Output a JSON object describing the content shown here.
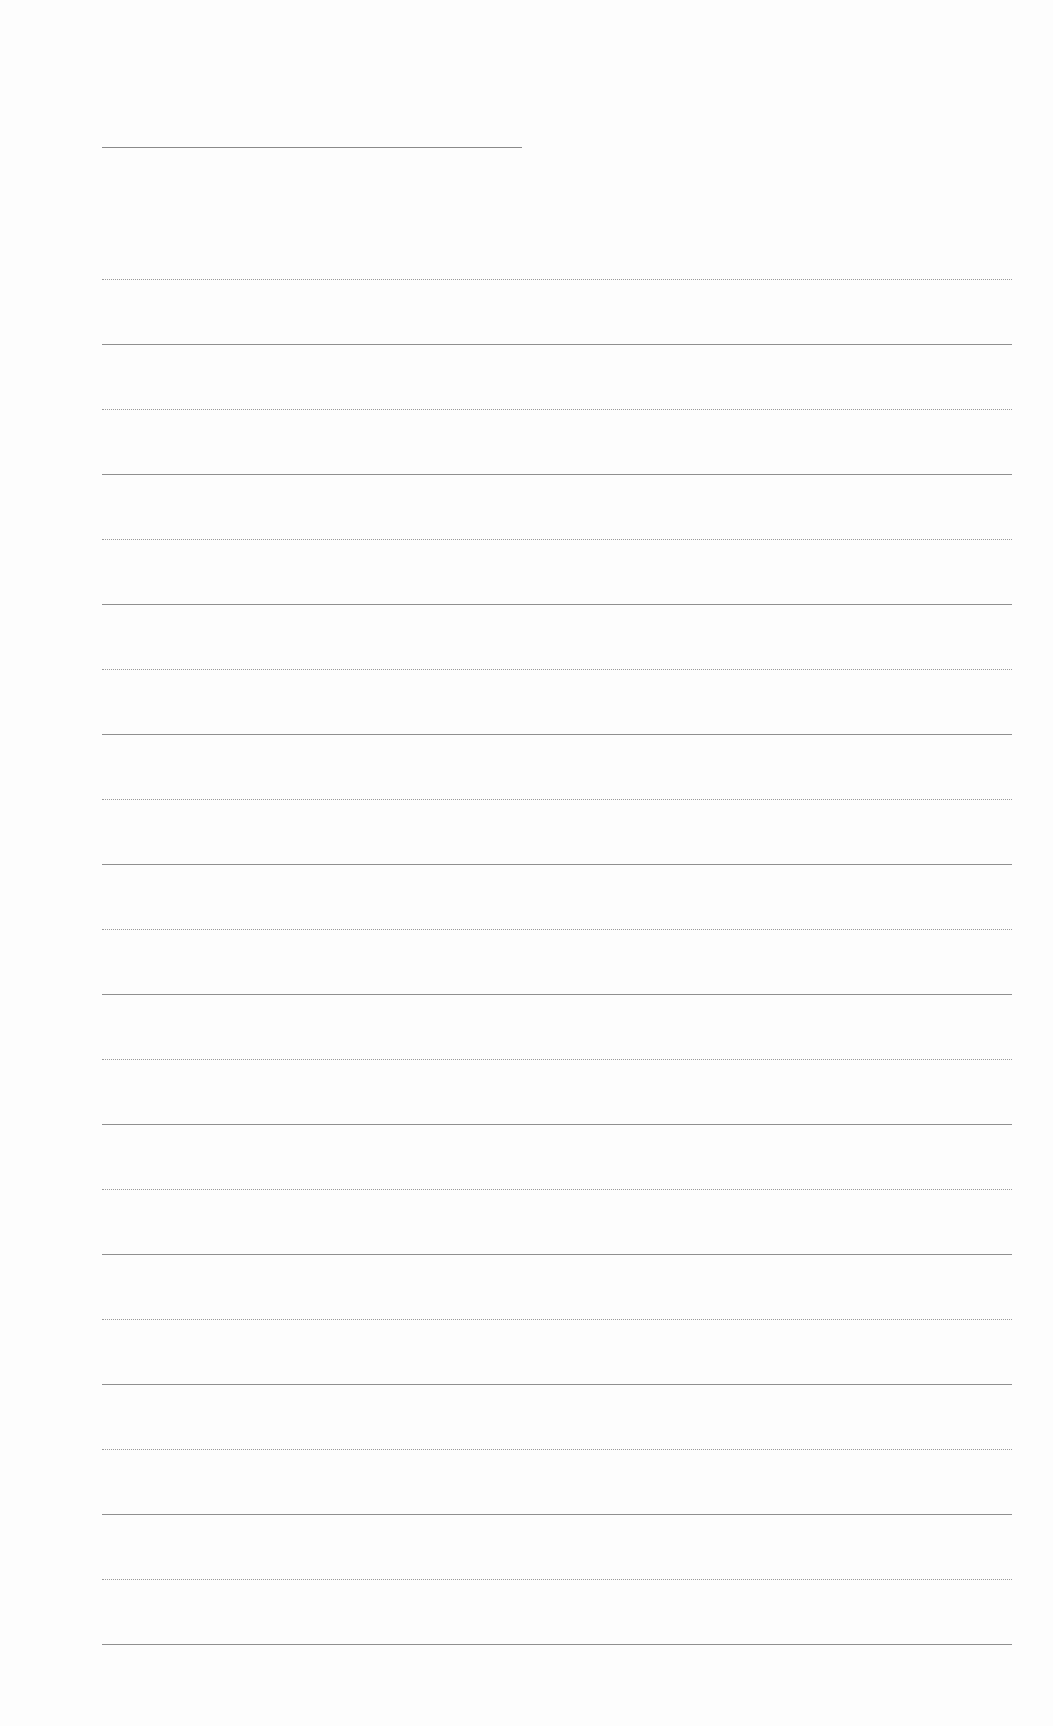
{
  "page": {
    "type": "lined-paper",
    "background": "#fdfdfd",
    "line_color": "#8f8f8f",
    "title_line": {
      "x": 102,
      "y": 147,
      "width": 420
    },
    "ruled_lines": {
      "count": 22,
      "start_y": 279,
      "spacing": 65,
      "x": 102,
      "width": 910,
      "pattern": [
        "dotted",
        "solid"
      ]
    }
  }
}
